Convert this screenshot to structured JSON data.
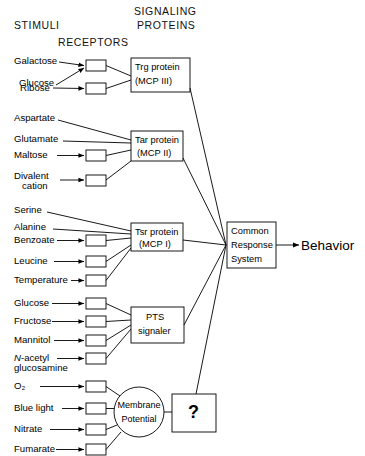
{
  "figure": {
    "type": "diagram",
    "headers": {
      "stimuli": "STIMULI",
      "receptors": "RECEPTORS",
      "signaling_line1": "SIGNALING",
      "signaling_line2": "PROTEINS"
    },
    "groups": [
      {
        "id": "trg",
        "protein_line1": "Trg protein",
        "protein_line2": "(MCP III)",
        "stimuli": [
          {
            "label": "Galactose",
            "has_receptor_box": true,
            "shared_box": true
          },
          {
            "label": "Glucose",
            "has_receptor_box": true,
            "shared_box": true
          },
          {
            "label": "Ribose",
            "has_receptor_box": true,
            "shared_box": false
          }
        ]
      },
      {
        "id": "tar",
        "protein_line1": "Tar protein",
        "protein_line2": "(MCP II)",
        "stimuli": [
          {
            "label": "Aspartate",
            "has_receptor_box": false
          },
          {
            "label": "Glutamate",
            "has_receptor_box": false
          },
          {
            "label": "Maltose",
            "has_receptor_box": true
          },
          {
            "label": "Divalent",
            "label2": "cation",
            "has_receptor_box": true
          }
        ]
      },
      {
        "id": "tsr",
        "protein_line1": "Tsr protein",
        "protein_line2": "(MCP I)",
        "stimuli": [
          {
            "label": "Serine",
            "has_receptor_box": false
          },
          {
            "label": "Alanine",
            "has_receptor_box": false
          },
          {
            "label": "Benzoate",
            "has_receptor_box": true
          },
          {
            "label": "Leucine",
            "has_receptor_box": true
          },
          {
            "label": "Temperature",
            "has_receptor_box": true
          }
        ]
      },
      {
        "id": "pts",
        "protein_line1": "PTS",
        "protein_line2": "signaler",
        "stimuli": [
          {
            "label": "Glucose",
            "has_receptor_box": true
          },
          {
            "label": "Fructose",
            "has_receptor_box": true
          },
          {
            "label": "Mannitol",
            "has_receptor_box": true
          },
          {
            "label": "N-acetyl",
            "label2": "glucosamine",
            "has_receptor_box": true,
            "italic_prefix": "N-"
          }
        ]
      },
      {
        "id": "membrane",
        "protein_line1": "Membrane",
        "protein_line2": "Potential",
        "shape": "circle",
        "downstream": "?",
        "stimuli": [
          {
            "label": "O₂",
            "has_receptor_box": true
          },
          {
            "label": "Blue light",
            "has_receptor_box": true
          },
          {
            "label": "Nitrate",
            "has_receptor_box": true
          },
          {
            "label": "Fumarate",
            "has_receptor_box": true
          }
        ]
      }
    ],
    "common_response": {
      "line1": "Common",
      "line2": "Response",
      "line3": "System"
    },
    "unknown_box_label": "?",
    "output_label": "Behavior",
    "colors": {
      "stroke": "#000000",
      "background": "#ffffff",
      "text": "#000000"
    }
  }
}
